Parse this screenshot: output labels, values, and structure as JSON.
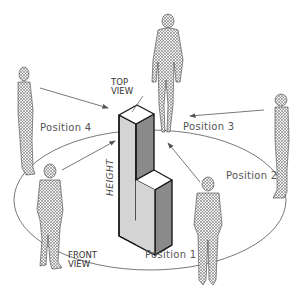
{
  "diagram": {
    "labels": {
      "top_view": "TOP\nVIEW",
      "front_view": "FRONT\nVIEW",
      "height": "HEIGHT",
      "position_1": "Position 1",
      "position_2": "Position 2",
      "position_3": "Position 3",
      "position_4": "Position 4"
    },
    "colors": {
      "left_face": "#d4d4d4",
      "right_face": "#8a8a8a",
      "top_face": "#ffffff",
      "outline": "#1a1a1a",
      "ellipse": "#555555",
      "arrow": "#555555",
      "figure": "#777777"
    },
    "figures": [
      {
        "id": "viewer-top",
        "position": "top center, standing above block"
      },
      {
        "id": "viewer-position-4",
        "position": "left, side profile"
      },
      {
        "id": "viewer-front",
        "position": "lower left, front view"
      },
      {
        "id": "viewer-position-1",
        "position": "lower right"
      },
      {
        "id": "viewer-position-2",
        "position": "right, side profile"
      }
    ]
  }
}
